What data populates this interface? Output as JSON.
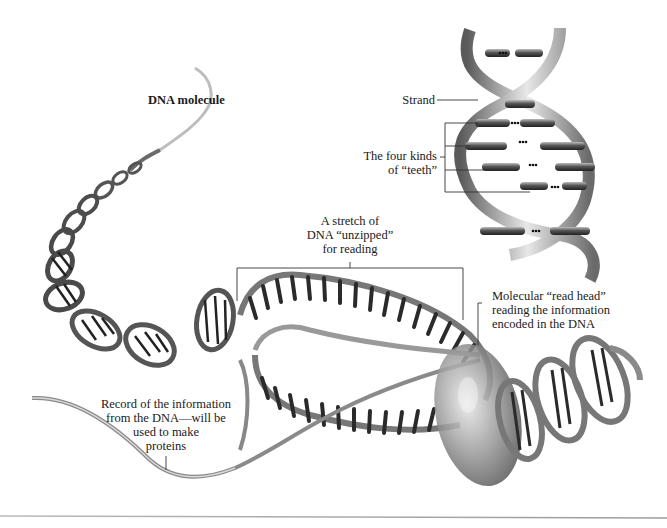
{
  "diagram": {
    "type": "labeled-illustration",
    "labels": {
      "dna_molecule": "DNA molecule",
      "strand": "Strand",
      "four_kinds_teeth": [
        "The four kinds",
        "of “teeth”"
      ],
      "unzipped_stretch": [
        "A stretch of",
        "DNA “unzipped”",
        "for reading"
      ],
      "read_head": [
        "Molecular “read head”",
        "reading the information",
        "encoded in the DNA"
      ],
      "record": [
        "Record of the information",
        "from the DNA—will be",
        "used to make",
        "proteins"
      ]
    },
    "inset": {
      "description": "Close-up of double helix showing strands and paired teeth",
      "base_pair_marker": "•••"
    },
    "colors": {
      "background": "#ffffff",
      "text": "#1a1a1a",
      "leader_line": "#333333",
      "strand_light": "#e6e6e6",
      "strand_mid": "#9a9a9a",
      "strand_dark": "#3a3a3a",
      "read_head": "#8a8a8a",
      "bottom_rule": "#a8a8a8"
    }
  }
}
